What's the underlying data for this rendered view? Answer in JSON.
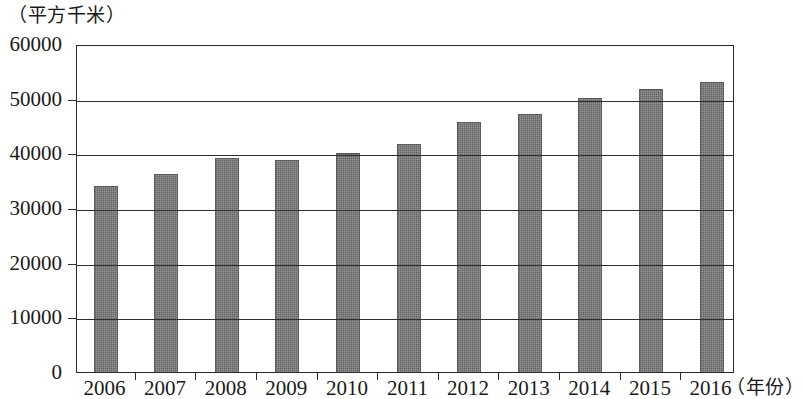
{
  "chart_data": {
    "type": "bar",
    "title": "",
    "subtitle": "",
    "xlabel": "（年份）",
    "ylabel": "（平方千米）",
    "categories": [
      "2006",
      "2007",
      "2008",
      "2009",
      "2010",
      "2011",
      "2012",
      "2013",
      "2014",
      "2015",
      "2016"
    ],
    "values": [
      34000,
      36300,
      39100,
      38700,
      40000,
      41800,
      45800,
      47200,
      50100,
      51700,
      53000
    ],
    "series": [
      {
        "name": "面积",
        "values": [
          34000,
          36300,
          39100,
          38700,
          40000,
          41800,
          45800,
          47200,
          50100,
          51700,
          53000
        ]
      }
    ],
    "ylim": [
      0,
      60000
    ],
    "y_ticks": [
      "0",
      "10000",
      "20000",
      "30000",
      "40000",
      "50000",
      "60000"
    ],
    "y_tick_values": [
      0,
      10000,
      20000,
      30000,
      40000,
      50000,
      60000
    ],
    "grid": true,
    "legend": false,
    "legend_position": "none",
    "bar_color": "#6f6f6f",
    "axis_color": "#2f2f2f"
  },
  "axes": {
    "y_unit_label": "（平方千米）",
    "x_unit_label": "（年份）"
  }
}
